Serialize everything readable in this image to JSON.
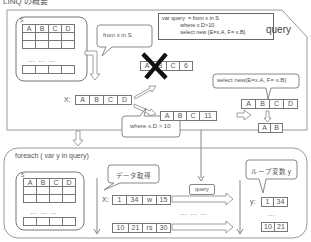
{
  "title": "LINQ の概要",
  "top_panel": {
    "source_label": "S",
    "source_table": {
      "headers": [
        "A",
        "B",
        "C",
        "D"
      ],
      "dots": "…  …  …"
    },
    "from_bubble": "from x in S",
    "code_box": {
      "lines": [
        "var query  = from x in S",
        "            where x.D>10",
        "            select new {E=x.A, F= x.B}"
      ]
    },
    "query_label": "query",
    "x_row": {
      "label": "X:",
      "cells": [
        "A",
        "B",
        "C",
        "D"
      ]
    },
    "rejected_row": {
      "cells": [
        "A",
        "B",
        "C",
        "6"
      ],
      "status": "rejected"
    },
    "accepted_row": {
      "cells": [
        "A",
        "B",
        "C",
        "11"
      ]
    },
    "where_bubble": "where x.D > 10",
    "select_bubble": "select new{E=x.A, F= x.B}",
    "select_row": {
      "cells": [
        "A",
        "B",
        "C",
        "D"
      ]
    },
    "result_row": {
      "cells": [
        "A",
        "B"
      ]
    }
  },
  "bottom_panel": {
    "foreach_label": "foreach ( var y in query)",
    "source_label": "S",
    "source_table": {
      "headers": [
        "A",
        "B",
        "C",
        "D"
      ],
      "dots": "…  …  …"
    },
    "fetch_bubble": "データ取得",
    "x_label": "X:",
    "row1": [
      "1",
      "34",
      "w",
      "15"
    ],
    "middle_dots": "…  …  …",
    "row2": [
      "10",
      "21",
      "rs",
      "30"
    ],
    "query_tag": "query",
    "loop_bubble": "ループ変数 y",
    "y_label": "y:",
    "y_row1": [
      "1",
      "34"
    ],
    "y_dots": "…",
    "y_row2": [
      "10",
      "21"
    ]
  }
}
